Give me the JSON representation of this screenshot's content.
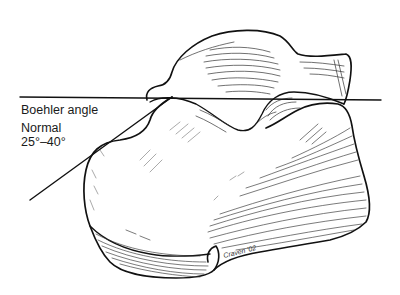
{
  "figure": {
    "labels": {
      "title": "Boehler angle",
      "normal_label": "Normal",
      "normal_range": "25°–40°"
    },
    "signature": "Craven '02",
    "colors": {
      "ink": "#111111",
      "hatch": "#333333",
      "background": "#ffffff"
    },
    "lines": {
      "horizontal": {
        "x1": 20,
        "y1": 97,
        "x2": 381,
        "y2": 100
      },
      "diagonal": {
        "x1": 30,
        "y1": 200,
        "x2": 172,
        "y2": 97
      }
    }
  }
}
